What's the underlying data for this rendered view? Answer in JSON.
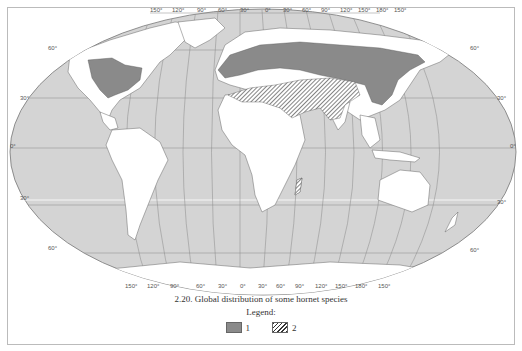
{
  "figure": {
    "caption": "2.20. Global distribution of some hornet species",
    "legend_title": "Legend:",
    "legend": [
      {
        "label": "1",
        "pattern": "solid-gray",
        "color": "#8a8a8a"
      },
      {
        "label": "2",
        "pattern": "diagonal-hatch",
        "color": "#333333"
      }
    ]
  },
  "map": {
    "projection": "Robinson-like world projection",
    "ocean_color": "#d4d4d4",
    "land_color": "#ffffff",
    "range_color": "#8a8a8a",
    "longitude_labels_top": [
      "150°",
      "120°",
      "90°",
      "60°",
      "30°",
      "0°",
      "30°",
      "60°",
      "90°",
      "120°",
      "150°",
      "180°",
      "150°"
    ],
    "longitude_labels_bottom": [
      "150°",
      "120°",
      "90°",
      "60°",
      "30°",
      "0°",
      "30°",
      "60°",
      "90°",
      "120°",
      "150°",
      "180°",
      "150°"
    ],
    "latitude_labels_left": [
      "60°",
      "30°",
      "0°",
      "30°",
      "60°"
    ],
    "latitude_labels_right": [
      "60°",
      "30°",
      "0°",
      "30°",
      "60°"
    ],
    "ranges": [
      {
        "legend": "1",
        "regions": [
          "Eastern North America",
          "Europe",
          "Central Asia",
          "Siberia (south)",
          "China",
          "Korea",
          "Japan"
        ]
      },
      {
        "legend": "2",
        "regions": [
          "North Africa",
          "Middle East",
          "Arabian Peninsula",
          "Iran",
          "Pakistan",
          "Northern India",
          "Madagascar"
        ]
      }
    ]
  }
}
